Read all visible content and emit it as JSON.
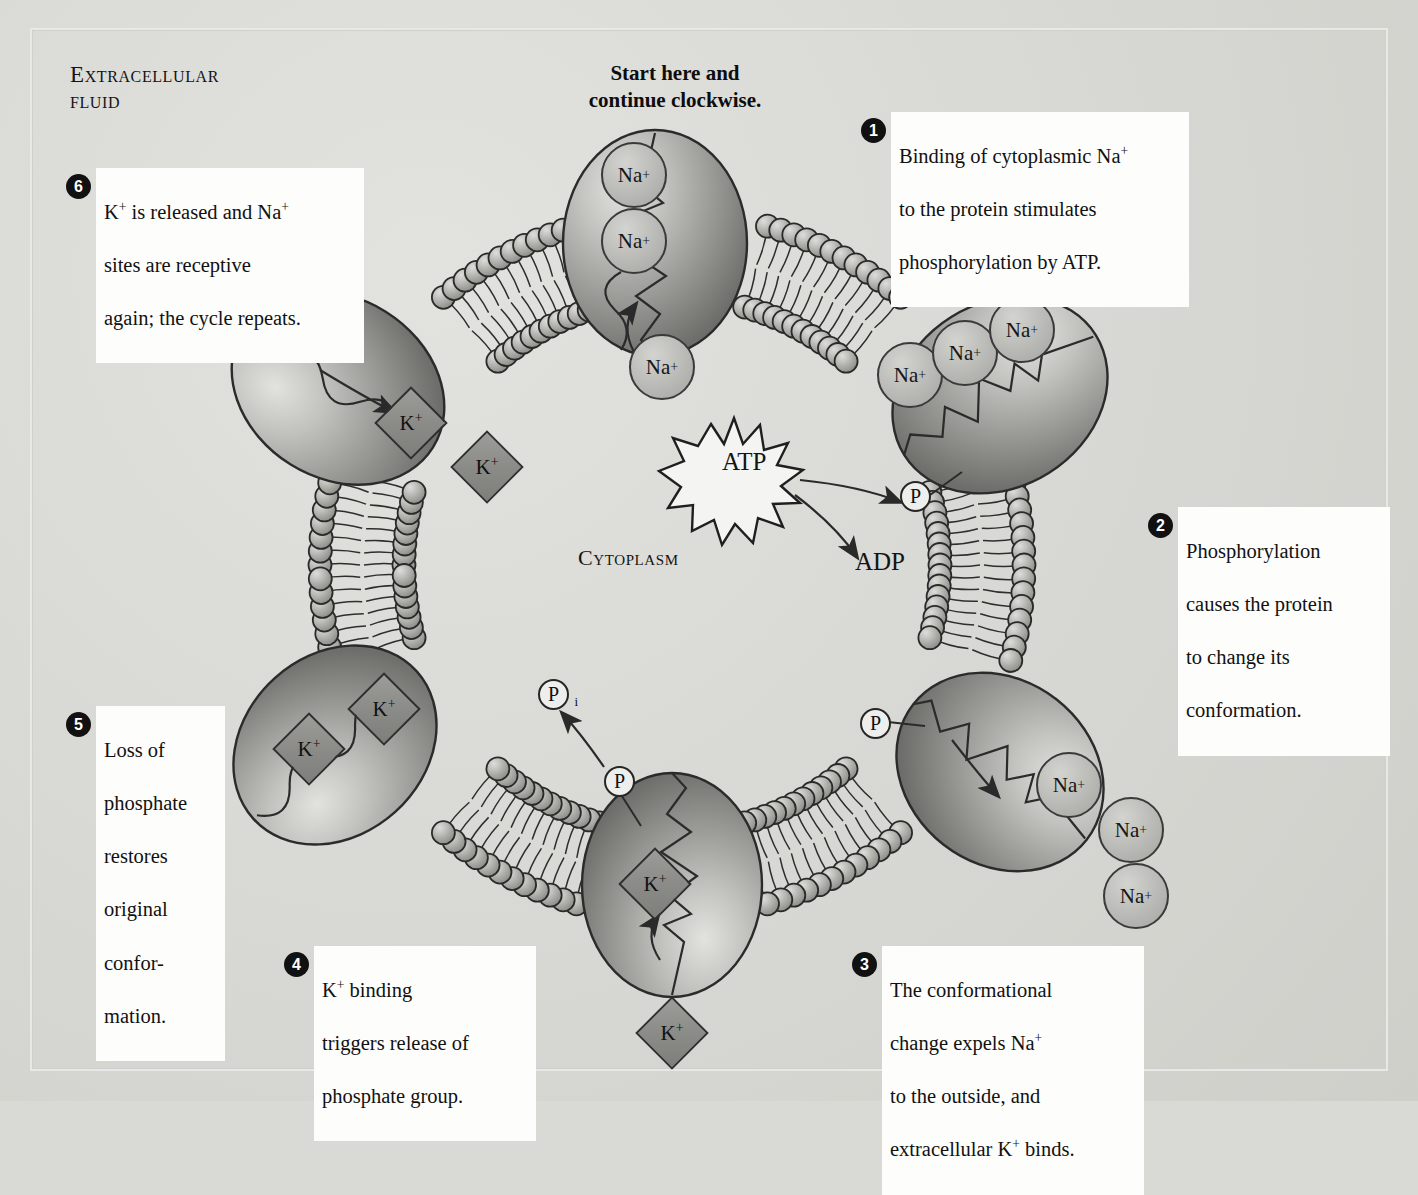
{
  "figure": {
    "compartment_labels": {
      "extracellular": "Extracellular\nfluid",
      "cytoplasm": "Cytoplasm"
    },
    "start_note": "Start here and\ncontinue clockwise.",
    "energy": {
      "atp": "ATP",
      "adp": "ADP",
      "phosphate": "P",
      "inorganic_phosphate": "P",
      "inorganic_phosphate_subscript": "i"
    },
    "ion_labels": {
      "sodium": "Na",
      "sodium_charge": "+",
      "potassium": "K",
      "potassium_charge": "+"
    }
  },
  "steps": [
    {
      "number": "1",
      "text": "Binding of cytoplasmic Na+\nto the protein stimulates\nphosphorylation by ATP.",
      "lines": [
        "Binding of cytoplasmic Na",
        "to the protein stimulates",
        "phosphorylation by ATP."
      ]
    },
    {
      "number": "2",
      "text": "Phosphorylation\ncauses the protein\nto change its\nconformation.",
      "lines": [
        "Phosphorylation",
        "causes the protein",
        "to change its",
        "conformation."
      ]
    },
    {
      "number": "3",
      "text": "The conformational\nchange expels Na+\nto the outside, and\nextracellular K+ binds.",
      "lines": [
        "The conformational",
        "change expels Na",
        "to the outside, and",
        "extracellular K"
      ]
    },
    {
      "number": "4",
      "text": "K+ binding\ntriggers release of\nphosphate group.",
      "lines": [
        "K",
        "triggers release of",
        "phosphate group."
      ]
    },
    {
      "number": "5",
      "text": "Loss of\nphosphate\nrestores\noriginal\nconfor-\nmation.",
      "lines": [
        "Loss of",
        "phosphate",
        "restores",
        "original",
        "confor-",
        "mation."
      ]
    },
    {
      "number": "6",
      "text": "K+ is released and Na+\nsites are receptive\nagain; the cycle repeats.",
      "lines": [
        "K",
        "sites are receptive",
        "again; the cycle repeats."
      ]
    }
  ],
  "colors": {
    "background": "#d6d6d2",
    "label_box": "#fdfdfc",
    "step_badge": "#111111",
    "protein_light": "#c6c6c2",
    "protein_dark": "#6f6f6b",
    "membrane_head": "#b3b3ae",
    "ion_na": "#bcbcb8",
    "ion_k": "#8e8e8a",
    "ink": "#141414"
  },
  "ion_counts": {
    "step1_bound_na": 2,
    "step1_incoming_na": 1,
    "step2_bound_na": 3,
    "step3_released_na": 3,
    "step4_bound_k": 1,
    "step4_incoming_k": 1,
    "step5_bound_k": 2,
    "step6_released_k": 2
  }
}
